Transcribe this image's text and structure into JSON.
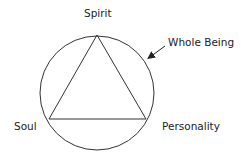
{
  "diagram": {
    "labels": {
      "spirit": "Spirit",
      "whole_being": "Whole Being",
      "soul": "Soul",
      "personality": "Personality"
    },
    "shapes": {
      "circle": {
        "cx": 97,
        "cy": 93,
        "r": 57
      },
      "triangle": {
        "apex": [
          97,
          35
        ],
        "bottom_left": [
          49,
          119
        ],
        "bottom_right": [
          146,
          119
        ]
      },
      "arrow": {
        "from": [
          165,
          46
        ],
        "to": [
          147,
          59
        ]
      }
    },
    "colors": {
      "stroke": "#333333",
      "text": "#222222",
      "background": "#ffffff"
    }
  }
}
